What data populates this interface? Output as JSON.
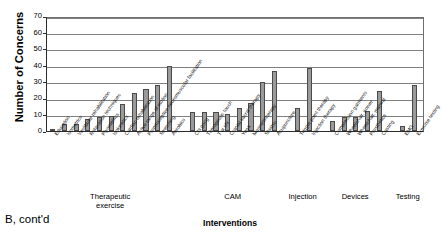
{
  "panel_label": "B, cont'd",
  "axis": {
    "ylabel": "Number of Concerns",
    "xlabel": "Interventions",
    "yticks": [
      "0",
      "10",
      "20",
      "30",
      "40",
      "50",
      "60",
      "70"
    ]
  },
  "groups": [
    {
      "name": "Therapeutic exercise",
      "label_lines": [
        "Therapeutic",
        "exercise"
      ]
    },
    {
      "name": "CAM",
      "label_lines": [
        "CAM"
      ]
    },
    {
      "name": "Injection",
      "label_lines": [
        "Injection"
      ]
    },
    {
      "name": "Devices",
      "label_lines": [
        "Devices"
      ]
    },
    {
      "name": "Testing",
      "label_lines": [
        "Testing"
      ]
    }
  ],
  "colors": {
    "bar_fill": "#9a9a9a",
    "bar_stroke": "#4a4a4a",
    "grid": "#808080",
    "axis": "#2b2b2b",
    "background": "#ffffff"
  },
  "chart_data": {
    "type": "bar",
    "title": "",
    "xlabel": "Interventions",
    "ylabel": "Number of Concerns",
    "ylim": [
      0,
      70
    ],
    "ytick_step": 10,
    "grid": true,
    "legend": "none",
    "categories": [
      "Education",
      "Isometrics",
      "Vestibular rehabilitation",
      "Relaxation techniques",
      "Plyometrics",
      "Isokinetics",
      "Cardiac rehabilitation",
      "Active range of motion",
      "Proprioceptive neuromuscular facilitation",
      "Stretching",
      "Aerobics",
      "Chi gong",
      "Therapeutic touch",
      "T'ai chi",
      "Cranial sacral therapy",
      "Yoga",
      "Magnetotherapy",
      "Shiatsu",
      "Acupuncture",
      "Trigger point therapy",
      "Injection therapy",
      "Compression garments",
      "Wheelchair, power",
      "Wheelchair, manual",
      "Prosthetics",
      "Casting",
      "EMG",
      "Exercise testing"
    ],
    "values": [
      1,
      4,
      4,
      7,
      8,
      9,
      16,
      23,
      25,
      28,
      39,
      11,
      11,
      11,
      10,
      13.5,
      16.5,
      29.5,
      36.5,
      14,
      38,
      6,
      8,
      8,
      12,
      24,
      3,
      28
    ],
    "group_index": [
      0,
      0,
      0,
      0,
      0,
      0,
      0,
      0,
      0,
      0,
      0,
      1,
      1,
      1,
      1,
      1,
      1,
      1,
      1,
      2,
      2,
      3,
      3,
      3,
      3,
      3,
      4,
      4
    ]
  }
}
